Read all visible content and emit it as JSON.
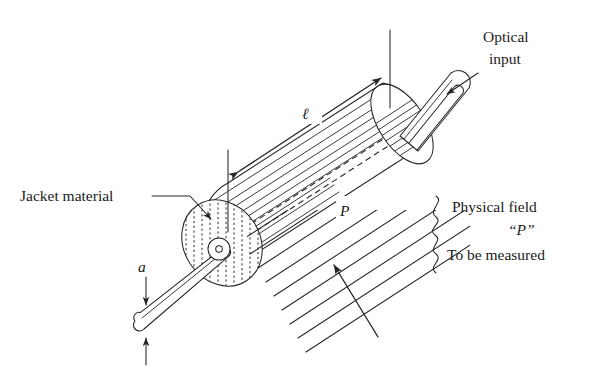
{
  "figure": {
    "background_color": "#ffffff",
    "ink_color": "#252525"
  },
  "labels": {
    "optical_input_line1": "Optical",
    "optical_input_line2": "input",
    "jacket_material": "Jacket material",
    "length_symbol": "ℓ",
    "diameter_symbol": "a",
    "field_symbol": "P",
    "field_symbol_quoted": "“P”",
    "physical_field_line1": "Physical field",
    "physical_field_line3": "To be measured"
  },
  "annotations": {
    "length_dimension": {
      "symbol": "ℓ",
      "description": "sensing length of jacketed fiber",
      "arrow_style": "double-headed"
    },
    "diameter_dimension": {
      "symbol": "a",
      "description": "fiber diameter",
      "arrow_style": "double-headed-vertical"
    },
    "field_arrow": {
      "symbol": "P",
      "description": "physical field acting on the sensing region",
      "arrow_style": "single-headed"
    },
    "brace": {
      "glyph": "}",
      "description": "curly brace grouping the physical field caption"
    }
  },
  "parts": {
    "cylinder": "jacketed sensing element",
    "end_cap_near": "stippled cross-section of jacket",
    "end_cap_far": "hatched far end of jacket",
    "fiber_pigtail_input": "optical fiber lead at upper right",
    "fiber_pigtail_output": "optical fiber lead at lower left",
    "core_line": "dashed optical fiber core inside jacket",
    "field_lines": "parallel diagonal lines representing the physical field"
  }
}
